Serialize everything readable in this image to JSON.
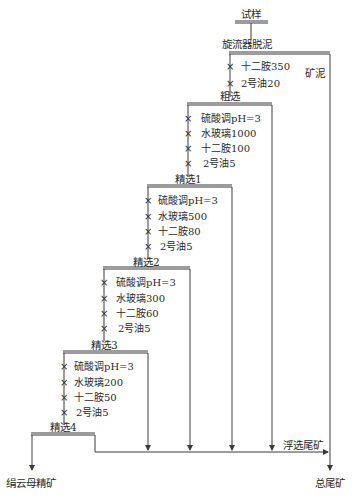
{
  "diagram": {
    "type": "flotation-flowsheet",
    "feed": "试样",
    "stages": [
      {
        "name": "旋流器脱泥",
        "reagents": [
          "十二胺350",
          "2号油20"
        ],
        "side_product": "矿泥"
      },
      {
        "name": "粗选",
        "reagents": [
          "硫酸调pH=3",
          "水玻璃1000",
          "十二胺100",
          "2号油5"
        ]
      },
      {
        "name": "精选1",
        "reagents": [
          "硫酸调pH=3",
          "水玻璃500",
          "十二胺80",
          "2号油5"
        ]
      },
      {
        "name": "精选2",
        "reagents": [
          "硫酸调pH=3",
          "水玻璃300",
          "十二胺60",
          "2号油5"
        ]
      },
      {
        "name": "精选3",
        "reagents": [
          "硫酸调pH=3",
          "水玻璃200",
          "十二胺50",
          "2号油5"
        ]
      },
      {
        "name": "精选4",
        "reagents": []
      }
    ],
    "outputs": {
      "concentrate": "绢云母精矿",
      "flotation_tailings": "浮选尾矿",
      "total_tailings": "总尾矿"
    },
    "colors": {
      "line": "#3a3a3a",
      "text": "#2a2a2a"
    }
  }
}
